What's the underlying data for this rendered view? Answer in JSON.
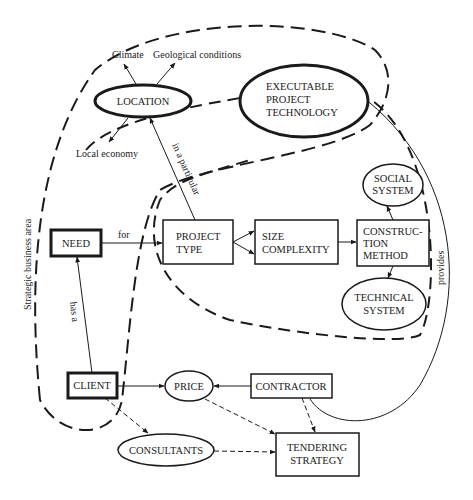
{
  "diagram": {
    "boundary_label": "Strategic business area",
    "nodes": {
      "location": "LOCATION",
      "climate": "Climate",
      "geological": "Geological conditions",
      "local_economy": "Local economy",
      "executable_l1": "EXECUTABLE",
      "executable_l2": "PROJECT",
      "executable_l3": "TECHNOLOGY",
      "need": "NEED",
      "project_type_l1": "PROJECT",
      "project_type_l2": "TYPE",
      "size_l1": "SIZE",
      "size_l2": "COMPLEXITY",
      "construction_l1": "CONSTRUC-",
      "construction_l2": "TION",
      "construction_l3": "METHOD",
      "social_l1": "SOCIAL",
      "social_l2": "SYSTEM",
      "technical_l1": "TECHNICAL",
      "technical_l2": "SYSTEM",
      "client": "CLIENT",
      "price": "PRICE",
      "contractor": "CONTRACTOR",
      "consultants": "CONSULTANTS",
      "tendering_l1": "TENDERING",
      "tendering_l2": "STRATEGY"
    },
    "edges": {
      "for": "for",
      "has_a": "has a",
      "in_a_particular": "in a particular",
      "provides": "provides"
    },
    "colors": {
      "stroke": "#1a1a1a",
      "background": "#ffffff"
    }
  }
}
